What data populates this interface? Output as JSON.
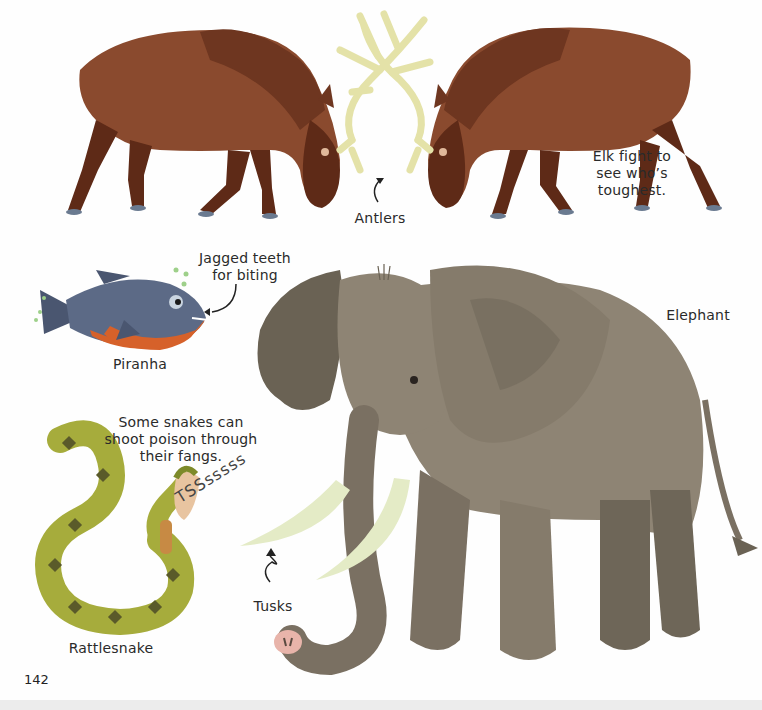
{
  "page": {
    "number": "142",
    "background": "#fefefe"
  },
  "elk": {
    "caption": "Elk fight to see who’s toughest.",
    "caption_lines": [
      "Elk fight to",
      "see who’s",
      "toughest."
    ],
    "antlers_label": "Antlers",
    "colors": {
      "body": "#8a4a2e",
      "legs": "#5e2a17",
      "antlers": "#e4e2a8"
    }
  },
  "piranha": {
    "name": "Piranha",
    "note_lines": [
      "Jagged teeth",
      "for biting"
    ],
    "colors": {
      "back": "#5c6a86",
      "belly": "#d6612a"
    }
  },
  "rattlesnake": {
    "name": "Rattlesnake",
    "note_lines": [
      "Some snakes can",
      "shoot poison through",
      "their fangs."
    ],
    "sound": "TSSsssss",
    "colors": {
      "body": "#a6ac3c",
      "spots": "#5a5a2a",
      "rattle": "#c78a44"
    }
  },
  "elephant": {
    "name": "Elephant",
    "tusks_label": "Tusks",
    "colors": {
      "body": "#8e8474",
      "dark": "#6a6254",
      "tusk": "#e4ebc6",
      "trunk_tip": "#e8b4aa"
    }
  }
}
